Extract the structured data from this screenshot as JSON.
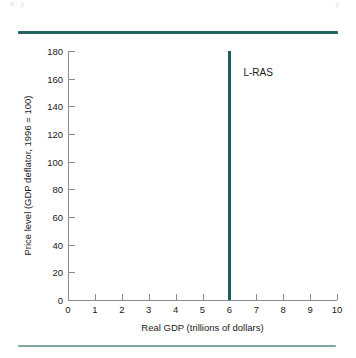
{
  "page": {
    "artifact_text_left": "a, y",
    "artifact_text_right": "y"
  },
  "chart_data": {
    "type": "line",
    "title": "",
    "xlabel": "Real GDP (trillions of dollars)",
    "ylabel": "Price level (GDP deflator, 1996 = 100)",
    "xlim": [
      0,
      10
    ],
    "ylim": [
      0,
      180
    ],
    "grid": false,
    "legend": "none",
    "xticks": [
      "0",
      "1",
      "2",
      "3",
      "4",
      "5",
      "6",
      "7",
      "8",
      "9",
      "10"
    ],
    "yticks": [
      "0",
      "20",
      "40",
      "60",
      "80",
      "100",
      "120",
      "140",
      "160",
      "180"
    ],
    "series": [
      {
        "name": "L-RAS",
        "annotation": "L-RAS",
        "orientation": "vertical",
        "x": 6,
        "y_from": 0,
        "y_to": 180,
        "color": "#1d5c5c"
      }
    ]
  },
  "decor": {
    "rule_top_color": "#266464",
    "rule_bottom_color": "#7ea6a2"
  }
}
